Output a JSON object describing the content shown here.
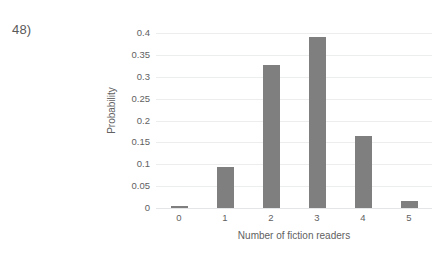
{
  "question_label": "48)",
  "chart_data": {
    "type": "bar",
    "title": "",
    "xlabel": "Number of fiction readers",
    "ylabel": "Probability",
    "categories": [
      "0",
      "1",
      "2",
      "3",
      "4",
      "5"
    ],
    "values": [
      0.005,
      0.093,
      0.328,
      0.391,
      0.165,
      0.015
    ],
    "ylim": [
      0,
      0.4
    ],
    "yticks": [
      "0.4",
      "0.35",
      "0.3",
      "0.25",
      "0.2",
      "0.15",
      "0.1",
      "0.05",
      "0"
    ],
    "ytick_values": [
      0.4,
      0.35,
      0.3,
      0.25,
      0.2,
      0.15,
      0.1,
      0.05,
      0
    ],
    "grid": true,
    "legend": false,
    "bar_color": "#7f7f7f",
    "gridline_color": "#eceded",
    "text_color": "#616161"
  }
}
